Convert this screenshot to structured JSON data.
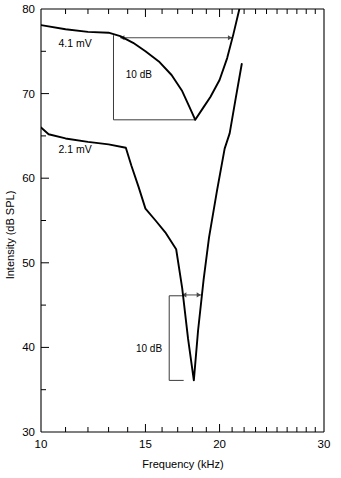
{
  "chart_data": {
    "type": "line",
    "title": "",
    "xlabel": "Frequency (kHz)",
    "ylabel": "Intensity (dB SPL)",
    "xscale": "log",
    "yscale": "linear",
    "xlim": [
      10,
      30
    ],
    "ylim": [
      30,
      80
    ],
    "grid": false,
    "legend_position": "inline-annotation",
    "x_ticks_major": [
      10,
      15,
      20,
      30
    ],
    "x_tick_labels": [
      "10",
      "15",
      "20",
      "30"
    ],
    "x_ticks_minor": [
      11,
      12,
      13,
      14,
      16,
      17,
      18,
      19,
      21,
      22,
      23,
      24,
      25,
      26,
      27,
      28,
      29
    ],
    "y_ticks_major": [
      30,
      40,
      50,
      60,
      70,
      80
    ],
    "y_tick_labels": [
      "30",
      "40",
      "50",
      "60",
      "70",
      "80"
    ],
    "y_ticks_minor": [
      35,
      45,
      55,
      65,
      75
    ],
    "series": [
      {
        "name": "4.1 mV",
        "label": "4.1 mV",
        "color": "#000000",
        "points": [
          [
            10.0,
            78.1
          ],
          [
            11.0,
            77.6
          ],
          [
            12.0,
            77.3
          ],
          [
            13.0,
            77.2
          ],
          [
            13.6,
            76.8
          ],
          [
            14.3,
            76.0
          ],
          [
            15.0,
            75.0
          ],
          [
            15.8,
            73.8
          ],
          [
            16.6,
            72.2
          ],
          [
            17.3,
            70.3
          ],
          [
            17.8,
            68.4
          ],
          [
            18.2,
            66.9
          ],
          [
            18.8,
            68.4
          ],
          [
            19.3,
            69.6
          ],
          [
            20.0,
            71.6
          ],
          [
            20.6,
            74.2
          ],
          [
            21.1,
            77.0
          ],
          [
            21.6,
            80.0
          ]
        ]
      },
      {
        "name": "2.1 mV",
        "label": "2.1 mV",
        "color": "#000000",
        "points": [
          [
            10.0,
            66.0
          ],
          [
            10.3,
            65.2
          ],
          [
            11.0,
            64.7
          ],
          [
            12.0,
            64.3
          ],
          [
            13.0,
            64.0
          ],
          [
            13.9,
            63.6
          ],
          [
            14.2,
            61.5
          ],
          [
            14.6,
            59.0
          ],
          [
            15.0,
            56.4
          ],
          [
            15.6,
            55.0
          ],
          [
            16.2,
            53.6
          ],
          [
            16.9,
            51.6
          ],
          [
            17.3,
            47.0
          ],
          [
            17.7,
            41.0
          ],
          [
            18.1,
            36.1
          ],
          [
            18.4,
            42.0
          ],
          [
            18.8,
            48.0
          ],
          [
            19.2,
            53.0
          ],
          [
            19.8,
            58.5
          ],
          [
            20.4,
            63.5
          ],
          [
            20.8,
            65.3
          ],
          [
            21.3,
            69.5
          ],
          [
            21.8,
            73.5
          ]
        ]
      }
    ],
    "annotations": [
      {
        "id": "upper-scale-bar",
        "kind": "scale-bracket",
        "label": "10 dB",
        "x_freq": 13.25,
        "y_top": 76.9,
        "y_bottom": 66.9,
        "foot_to_freq": 18.2
      },
      {
        "id": "upper-bandwidth-arrow",
        "kind": "double-arrow",
        "label": "",
        "y_db": 76.6,
        "x_from": 13.6,
        "x_to": 21.0
      },
      {
        "id": "lower-scale-bar",
        "kind": "scale-bracket-vertical",
        "label": "10 dB",
        "x_freq": 16.45,
        "y_top": 46.1,
        "y_bottom": 36.1,
        "cap_to_freq": 17.4
      },
      {
        "id": "lower-bandwidth-arrow",
        "kind": "double-arrow",
        "label": "",
        "y_db": 46.2,
        "x_from": 17.3,
        "x_to": 18.6
      }
    ],
    "series_label_positions": [
      {
        "label": "4.1 mV",
        "x_freq": 10.7,
        "y_db": 76.0
      },
      {
        "label": "2.1 mV",
        "x_freq": 10.7,
        "y_db": 63.4
      }
    ],
    "annotation_label_positions": [
      {
        "label": "10 dB",
        "x_freq": 13.9,
        "y_db": 72.3
      },
      {
        "label": "10 dB",
        "x_freq": 16.0,
        "y_db": 39.9,
        "anchor": "end"
      }
    ]
  },
  "axes": {
    "x_title": "Frequency (kHz)",
    "y_title": "Intensity (dB SPL)"
  }
}
